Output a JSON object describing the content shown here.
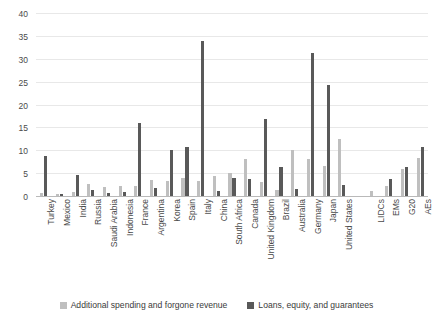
{
  "chart_data": {
    "type": "bar",
    "title": "",
    "xlabel": "",
    "ylabel": "",
    "ylim": [
      0,
      40
    ],
    "yticks": [
      0,
      5,
      10,
      15,
      20,
      25,
      30,
      35,
      40
    ],
    "grid": true,
    "legend_position": "bottom",
    "categories": [
      "Turkey",
      "Mexico",
      "India",
      "Russia",
      "Saudi Arabia",
      "Indonesia",
      "France",
      "Argentina",
      "Korea",
      "Spain",
      "Italy",
      "China",
      "South Africa",
      "Canada",
      "United Kingdom",
      "Brazil",
      "Australia",
      "Germany",
      "Japan",
      "United States",
      "LIDCs",
      "EMs",
      "G20",
      "AEs"
    ],
    "series": [
      {
        "name": "Additional spending and forgone revenue",
        "color": "#bfbfbf",
        "values": [
          0.8,
          0.7,
          1.2,
          2.9,
          2.2,
          2.4,
          2.5,
          3.8,
          3.4,
          4.1,
          3.4,
          4.7,
          5.3,
          8.4,
          3.3,
          1.5,
          10.3,
          8.3,
          6.8,
          12.7,
          1.4,
          2.5,
          6.1,
          8.6
        ]
      },
      {
        "name": "Loans, equity, and guarantees",
        "color": "#595959",
        "values": [
          9.0,
          0.6,
          4.9,
          1.5,
          0.9,
          1.2,
          16.2,
          2.0,
          10.2,
          10.9,
          34.0,
          1.3,
          4.2,
          4.0,
          17.0,
          6.6,
          1.8,
          31.5,
          24.4,
          2.6,
          0.1,
          3.9,
          6.5,
          11.0
        ]
      }
    ],
    "legend": [
      "Additional spending and forgone revenue",
      "Loans, equity, and guarantees"
    ]
  }
}
